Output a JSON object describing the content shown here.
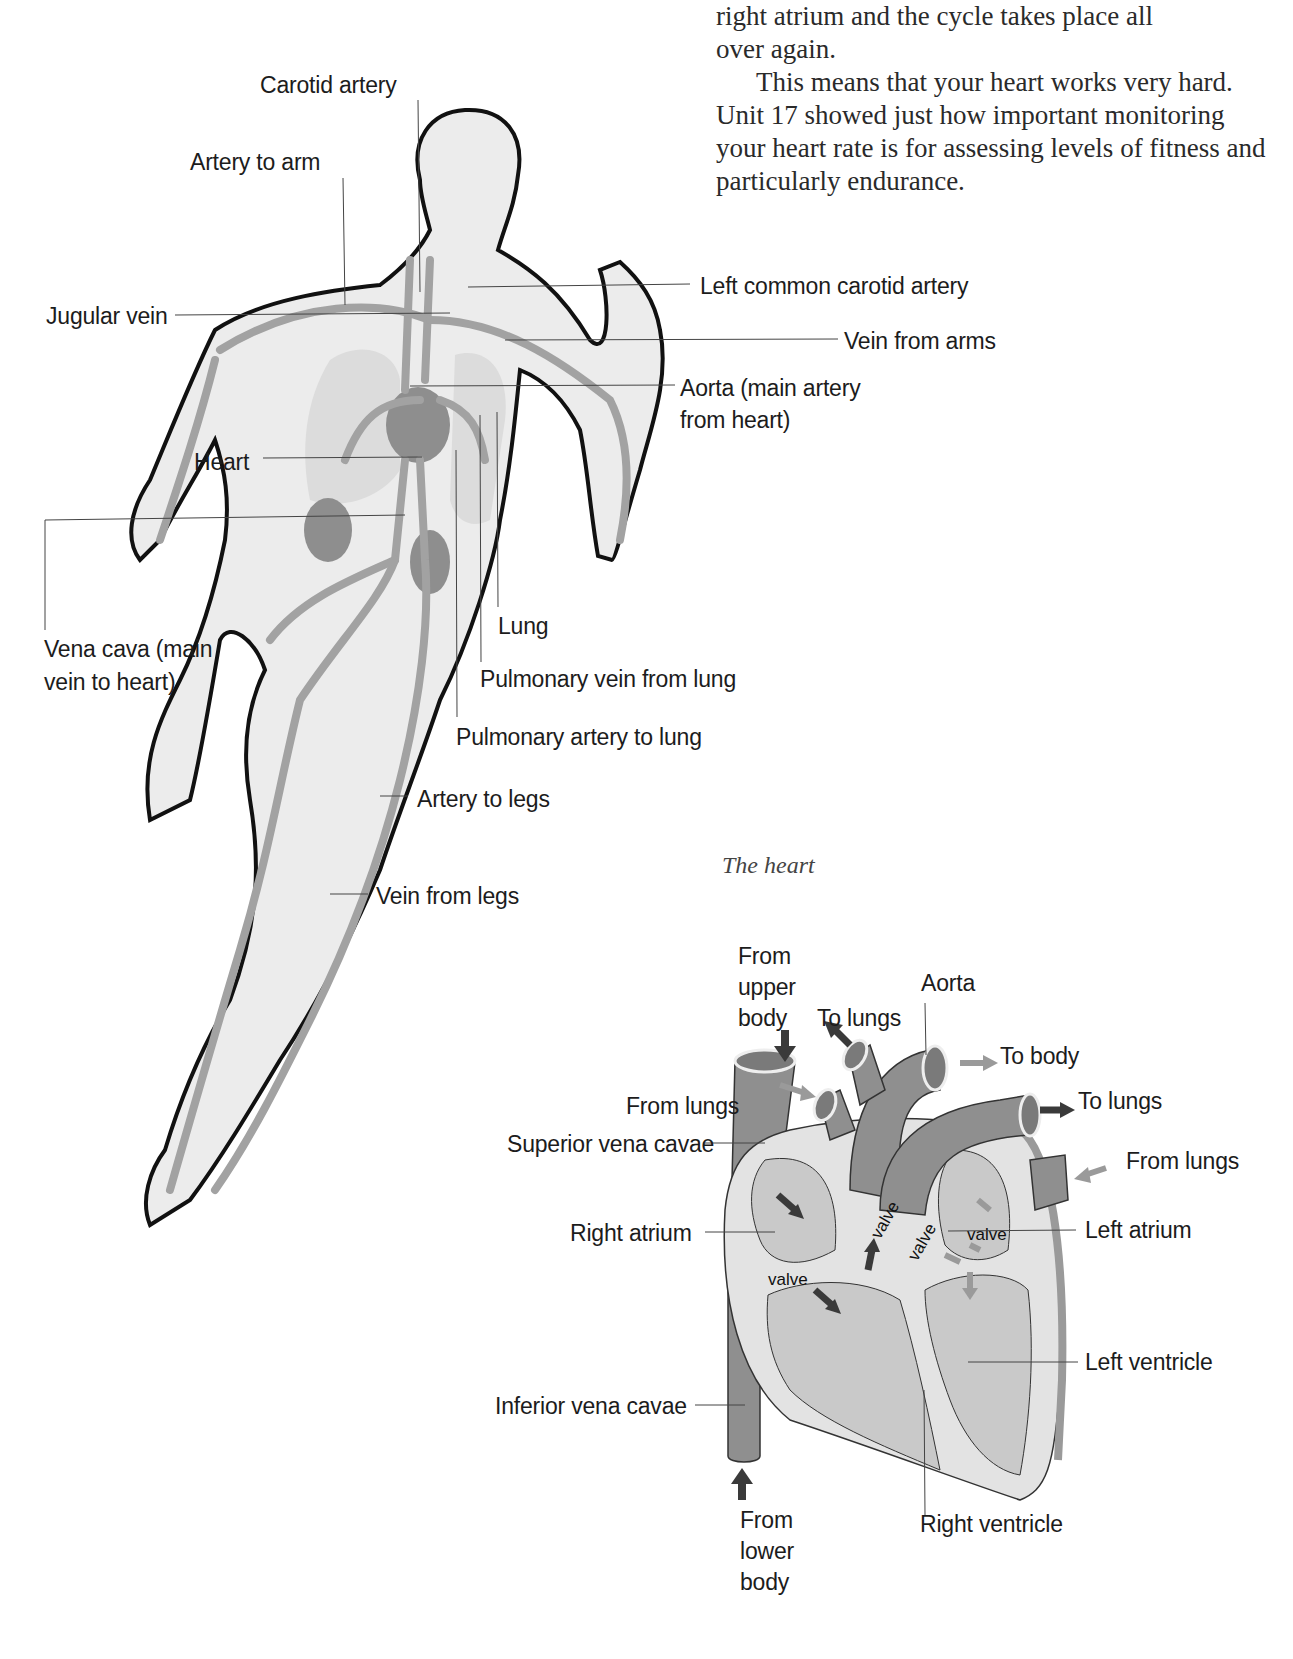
{
  "body_text": {
    "line1": "right atrium and the cycle takes place all",
    "line2": "over again.",
    "paragraph2": "This means that your heart works very hard. Unit 17 showed just how important monitoring your heart rate is for assessing levels of fitness and particularly endurance."
  },
  "body_diagram": {
    "labels": {
      "carotid_artery": "Carotid artery",
      "artery_to_arm": "Artery to arm",
      "jugular_vein": "Jugular vein",
      "left_common_carotid_artery": "Left common carotid artery",
      "vein_from_arms": "Vein from arms",
      "aorta_line1": "Aorta (main artery",
      "aorta_line2": "from heart)",
      "heart": "Heart",
      "vena_cava_line1": "Vena cava (main",
      "vena_cava_line2": "vein to heart)",
      "lung": "Lung",
      "pulmonary_vein": "Pulmonary vein from lung",
      "pulmonary_artery": "Pulmonary artery to lung",
      "artery_to_legs": "Artery to legs",
      "vein_from_legs": "Vein from legs"
    }
  },
  "heart_diagram": {
    "caption": "The heart",
    "labels": {
      "from_upper_body_1": "From",
      "from_upper_body_2": "upper",
      "from_upper_body_3": "body",
      "to_lungs_top": "To lungs",
      "aorta": "Aorta",
      "to_body": "To body",
      "to_lungs_right": "To lungs",
      "from_lungs_left": "From lungs",
      "from_lungs_right": "From lungs",
      "superior_vena_cavae": "Superior vena cavae",
      "right_atrium": "Right atrium",
      "left_atrium": "Left atrium",
      "left_ventricle": "Left ventricle",
      "inferior_vena_cavae": "Inferior vena cavae",
      "right_ventricle": "Right ventricle",
      "from_lower_body_1": "From",
      "from_lower_body_2": "lower",
      "from_lower_body_3": "body",
      "valve": "valve"
    },
    "colors": {
      "vessel": "#8f8f8f",
      "chamber": "#c9c9c9",
      "wall": "#e4e4e4",
      "arrow_dark": "#3a3a3a",
      "arrow_light": "#9a9a9a"
    }
  }
}
